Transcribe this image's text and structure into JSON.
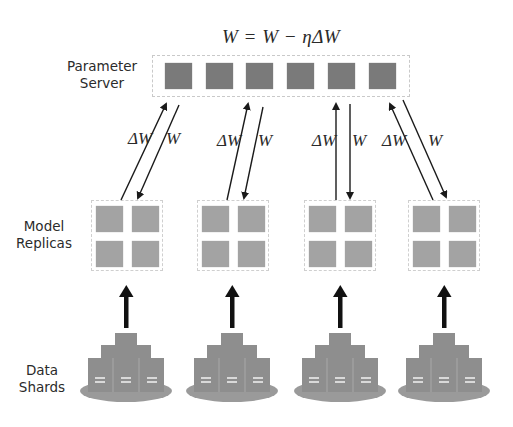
{
  "diagram": {
    "title_equation": "W = W − ηΔW",
    "row_labels": {
      "parameter_server": [
        "Parameter",
        "Server"
      ],
      "model_replicas": [
        "Model",
        "Replicas"
      ],
      "data_shards": [
        "Data",
        "Shards"
      ]
    },
    "parameter_server": {
      "block_count": 6,
      "block_color": "#7a7a7a"
    },
    "replicas": [
      {
        "id": 1,
        "push_label": "ΔW",
        "pull_label": "W"
      },
      {
        "id": 2,
        "push_label": "ΔW",
        "pull_label": "W"
      },
      {
        "id": 3,
        "push_label": "ΔW",
        "pull_label": "W"
      },
      {
        "id": 4,
        "push_label": "ΔW",
        "pull_label": "W"
      }
    ],
    "replica_block_color": "#a3a3a3",
    "shard_color": "#8e8e8e",
    "arrow_color": "#1a1a1a"
  }
}
